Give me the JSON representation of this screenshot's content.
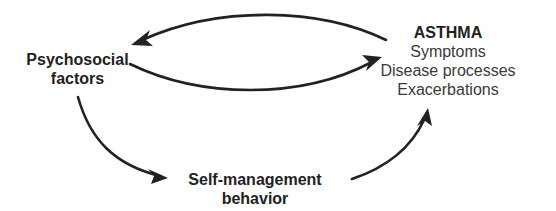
{
  "diagram": {
    "nodes": {
      "psychosocial": {
        "lines": [
          "Psychosocial",
          "factors"
        ]
      },
      "asthma": {
        "title": "ASTHMA",
        "lines": [
          "Symptoms",
          "Disease processes",
          "Exacerbations"
        ]
      },
      "self_management": {
        "lines": [
          "Self-management",
          "behavior"
        ]
      }
    },
    "edges": [
      {
        "from": "asthma",
        "to": "psychosocial"
      },
      {
        "from": "psychosocial",
        "to": "asthma"
      },
      {
        "from": "psychosocial",
        "to": "self_management"
      },
      {
        "from": "self_management",
        "to": "asthma"
      }
    ],
    "colors": {
      "ink": "#222222",
      "background": "#ffffff"
    }
  }
}
